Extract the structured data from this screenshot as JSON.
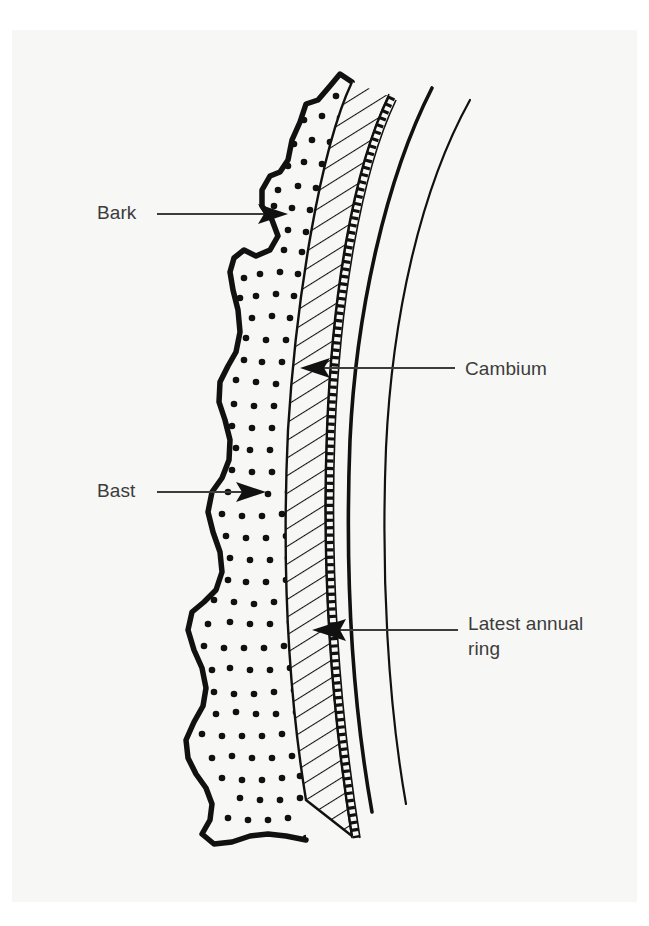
{
  "figure": {
    "background_color": "#ffffff",
    "paper_color": "#f7f7f5",
    "ink_color": "#111111",
    "label_color": "#3c3c3c"
  },
  "labels": {
    "bark": "Bark",
    "bast": "Bast",
    "cambium": "Cambium",
    "latest_annual_ring": "Latest annual\nring"
  },
  "diagram_data": {
    "type": "diagram",
    "subject": "tree trunk bark cross-section",
    "layers": [
      {
        "name": "Bark",
        "fill": "stippled-dots",
        "position": "outermost",
        "outline": "thick irregular wavy edge"
      },
      {
        "name": "Bast",
        "fill": "diagonal-hatching",
        "position": "beneath bark",
        "outline": "thin line"
      },
      {
        "name": "Cambium",
        "fill": "narrow-dashed-band",
        "position": "between bast and wood",
        "outline": "thin dashed band"
      },
      {
        "name": "Latest annual ring",
        "fill": "none",
        "position": "innermost shown, sapwood side",
        "outline": "thick solid curve"
      }
    ],
    "annotations": [
      {
        "label": "Bark",
        "arrow": "right",
        "target": "bark layer"
      },
      {
        "label": "Bast",
        "arrow": "right",
        "target": "bast layer"
      },
      {
        "label": "Cambium",
        "arrow": "left",
        "target": "cambium band"
      },
      {
        "label": "Latest annual\nring",
        "arrow": "left",
        "target": "latest annual ring line"
      }
    ]
  }
}
